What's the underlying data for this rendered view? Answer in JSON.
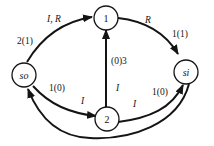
{
  "diagram": {
    "nodes": [
      {
        "id": "so",
        "label": "so",
        "italic": true
      },
      {
        "id": "1",
        "label": "1",
        "italic": false
      },
      {
        "id": "2",
        "label": "2",
        "italic": false
      },
      {
        "id": "si",
        "label": "si",
        "italic": true
      }
    ],
    "edges": [
      {
        "from": "so",
        "to": "1",
        "labels": [
          "I, R",
          "2(1)"
        ]
      },
      {
        "from": "1",
        "to": "si",
        "labels": [
          "R",
          "1(1)"
        ]
      },
      {
        "from": "so",
        "to": "2",
        "labels": [
          "1(0)",
          "I"
        ]
      },
      {
        "from": "2",
        "to": "1",
        "labels": [
          "(0)3",
          "I"
        ]
      },
      {
        "from": "2",
        "to": "si",
        "labels": [
          "I",
          "1(0)"
        ]
      },
      {
        "from": "si",
        "to": "so",
        "labels": []
      }
    ],
    "text": {
      "edge_so_1_top": "I, R",
      "edge_so_1_left": "2(1)",
      "edge_1_si_top": "R",
      "edge_1_si_right": "1(1)",
      "edge_so_2_upper": "1(0)",
      "edge_so_2_lower": "I",
      "edge_2_1_upper": "(0)3",
      "edge_2_1_lower": "I",
      "edge_2_si_lower": "I",
      "edge_2_si_upper": "1(0)"
    }
  }
}
